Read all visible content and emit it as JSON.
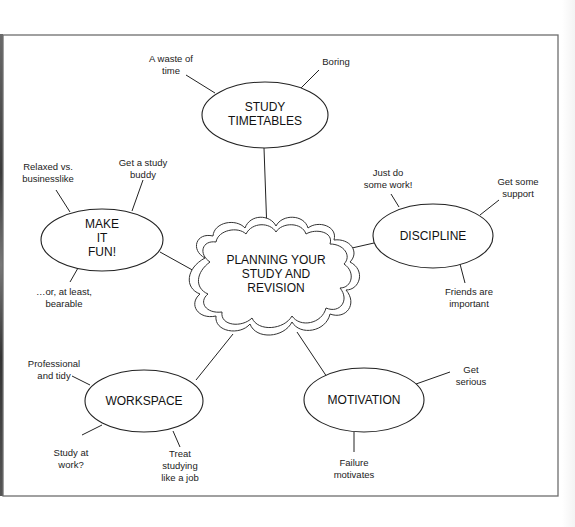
{
  "diagram": {
    "type": "mind-map",
    "center": {
      "lines": [
        "PLANNING YOUR",
        "STUDY AND",
        "REVISION"
      ]
    },
    "branches": [
      {
        "id": "study-timetables",
        "lines": [
          "STUDY",
          "TIMETABLES"
        ],
        "leaves": [
          {
            "lines": [
              "A waste of",
              "time"
            ]
          },
          {
            "lines": [
              "Boring"
            ]
          }
        ]
      },
      {
        "id": "make-it-fun",
        "lines": [
          "MAKE",
          "IT",
          "FUN!"
        ],
        "leaves": [
          {
            "lines": [
              "Relaxed vs.",
              "businesslike"
            ]
          },
          {
            "lines": [
              "Get a study",
              "buddy"
            ]
          },
          {
            "lines": [
              "…or, at least,",
              "bearable"
            ]
          }
        ]
      },
      {
        "id": "discipline",
        "lines": [
          "DISCIPLINE"
        ],
        "leaves": [
          {
            "lines": [
              "Just do",
              "some work!"
            ]
          },
          {
            "lines": [
              "Get some",
              "support"
            ]
          },
          {
            "lines": [
              "Friends are",
              "important"
            ]
          }
        ]
      },
      {
        "id": "workspace",
        "lines": [
          "WORKSPACE"
        ],
        "leaves": [
          {
            "lines": [
              "Professional",
              "and tidy"
            ]
          },
          {
            "lines": [
              "Study at",
              "work?"
            ]
          },
          {
            "lines": [
              "Treat",
              "studying",
              "like a job"
            ]
          }
        ]
      },
      {
        "id": "motivation",
        "lines": [
          "MOTIVATION"
        ],
        "leaves": [
          {
            "lines": [
              "Get",
              "serious"
            ]
          },
          {
            "lines": [
              "Failure",
              "motivates"
            ]
          }
        ]
      }
    ]
  }
}
